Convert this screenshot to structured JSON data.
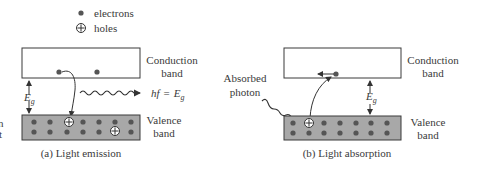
{
  "legend": {
    "electrons_label": "electrons",
    "holes_label": "holes"
  },
  "panel_a": {
    "conduction_label_1": "Conduction",
    "conduction_label_2": "band",
    "valence_label_1": "Valence",
    "valence_label_2": "band",
    "gap_label": "E",
    "gap_sub": "g",
    "photon_label_hf": "hf",
    "photon_label_eq": "=",
    "photon_label_E": "E",
    "photon_label_sub": "g",
    "caption": "(a) Light emission",
    "left_edge_fragment_1": "n",
    "left_edge_fragment_2": "t"
  },
  "panel_b": {
    "conduction_label_1": "Conduction",
    "conduction_label_2": "band",
    "valence_label_1": "Valence",
    "valence_label_2": "band",
    "gap_label": "E",
    "gap_sub": "g",
    "photon_label_1": "Absorbed",
    "photon_label_2": "photon",
    "caption": "(b) Light absorption"
  },
  "colors": {
    "band_fill": "#a8a8a8",
    "electron": "#555555",
    "outline": "#3a3a3a",
    "background": "#ffffff"
  }
}
